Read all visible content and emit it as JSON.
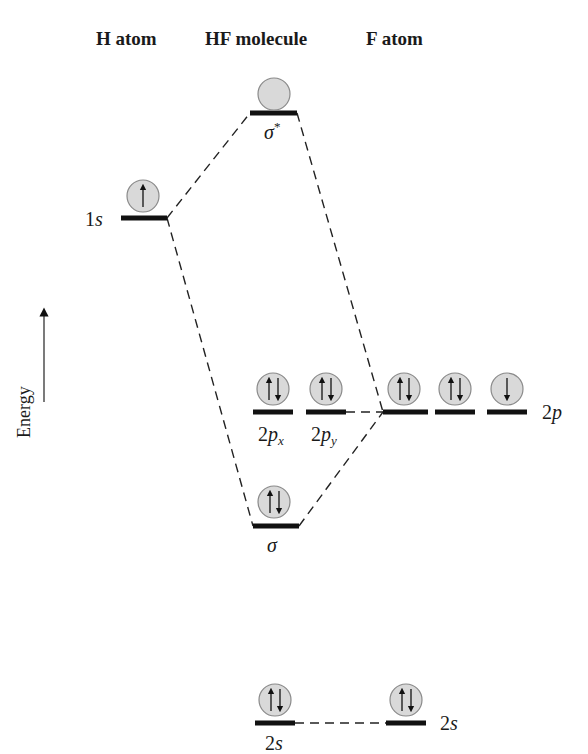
{
  "headers": {
    "h_atom": "H atom",
    "hf_molecule": "HF molecule",
    "f_atom": "F atom"
  },
  "axis": {
    "label": "Energy",
    "direction": "up"
  },
  "colors": {
    "level_line": "#111111",
    "dash_line": "#222222",
    "orbital_fill": "#d9d9d9",
    "orbital_stroke": "#8a8a8a",
    "arrow": "#111111"
  },
  "levels": {
    "sigma_star": {
      "label": "σ",
      "sup": "*",
      "electrons": "empty"
    },
    "h_1s": {
      "label_num": "1",
      "label_orb": "s",
      "electrons": "up"
    },
    "hf_2px": {
      "label_num": "2",
      "label_orb": "p",
      "sub": "x",
      "electrons": "up-down"
    },
    "hf_2py": {
      "label_num": "2",
      "label_orb": "p",
      "sub": "y",
      "electrons": "up-down"
    },
    "f_2p": {
      "label_num": "2",
      "label_orb": "p",
      "electrons": [
        "up-down",
        "up-down",
        "down"
      ]
    },
    "sigma": {
      "label": "σ",
      "electrons": "up-down"
    },
    "hf_2s": {
      "label_num": "2",
      "label_orb": "s",
      "electrons": "up-down"
    },
    "f_2s": {
      "label_num": "2",
      "label_orb": "s",
      "electrons": "up-down"
    }
  }
}
